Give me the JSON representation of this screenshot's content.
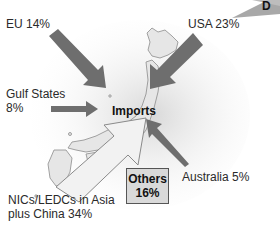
{
  "diagram": {
    "center_label": "Imports",
    "corner_badge": "D",
    "flows": [
      {
        "id": "eu",
        "label": "EU 14%",
        "source": "EU",
        "percent": 14
      },
      {
        "id": "usa",
        "label": "USA 23%",
        "source": "USA",
        "percent": 23
      },
      {
        "id": "gulf",
        "label": "Gulf States\n8%",
        "source": "Gulf States",
        "percent": 8
      },
      {
        "id": "australia",
        "label": "Australia 5%",
        "source": "Australia",
        "percent": 5
      },
      {
        "id": "asia",
        "label": "NICs/LEDCs in Asia\nplus China 34%",
        "source": "NICs/LEDCs in Asia plus China",
        "percent": 34
      }
    ],
    "others": {
      "line1": "Others",
      "line2": "16%",
      "percent": 16
    },
    "colors": {
      "arrow_dark": "#6e6e6e",
      "arrow_light_fill": "#f2f2f2",
      "arrow_light_stroke": "#8a8a8a",
      "map_fill": "#e6e6e6",
      "map_stroke": "#8c8c8c",
      "others_fill": "#d9d9d9",
      "badge_fill": "#a8a8a8"
    }
  }
}
